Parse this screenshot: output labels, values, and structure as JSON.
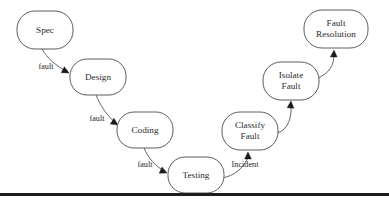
{
  "diagram": {
    "type": "flowchart",
    "style": {
      "node_fill": "#ffffff",
      "node_stroke": "#4a4a4a",
      "edge_stroke": "#555555",
      "arrow_fill": "#1a1a1a",
      "text_color": "#2b2b2b",
      "background": "#ffffff",
      "rule_color": "#1c1c1c"
    },
    "nodes": [
      {
        "id": "spec",
        "label": "Spec",
        "line1": "Spec",
        "line2": "",
        "cx": 45,
        "cy": 30,
        "rx": 28,
        "ry": 19
      },
      {
        "id": "design",
        "label": "Design",
        "line1": "Design",
        "line2": "",
        "cx": 98,
        "cy": 77,
        "rx": 28,
        "ry": 18
      },
      {
        "id": "coding",
        "label": "Coding",
        "line1": "Coding",
        "line2": "",
        "cx": 145,
        "cy": 130,
        "rx": 28,
        "ry": 18
      },
      {
        "id": "testing",
        "label": "Testing",
        "line1": "Testing",
        "line2": "",
        "cx": 196,
        "cy": 175,
        "rx": 28,
        "ry": 18
      },
      {
        "id": "classify",
        "label": "Classify Fault",
        "line1": "Classify",
        "line2": "Fault",
        "cx": 250,
        "cy": 131,
        "rx": 28,
        "ry": 19
      },
      {
        "id": "isolate",
        "label": "Isolate Fault",
        "line1": "Isolate",
        "line2": "Fault",
        "cx": 291,
        "cy": 81,
        "rx": 28,
        "ry": 19
      },
      {
        "id": "resolve",
        "label": "Fault Resolution",
        "line1": "Fault",
        "line2": "Resolution",
        "cx": 336,
        "cy": 29,
        "rx": 32,
        "ry": 19
      }
    ],
    "edges": [
      {
        "id": "e1",
        "from": "spec",
        "to": "design",
        "label": "fault",
        "label_x": 46,
        "label_y": 67,
        "path": "M 42 49 C 47 58 56 66 68 72"
      },
      {
        "id": "e2",
        "from": "design",
        "to": "coding",
        "label": "fault",
        "label_x": 97,
        "label_y": 119,
        "path": "M 96 95 C 100 105 107 116 117 124"
      },
      {
        "id": "e3",
        "from": "coding",
        "to": "testing",
        "label": "fault",
        "label_x": 145,
        "label_y": 165,
        "path": "M 144 148 C 148 158 156 167 166 172"
      },
      {
        "id": "e4",
        "from": "testing",
        "to": "classify",
        "label": "Incident",
        "label_x": 245,
        "label_y": 165,
        "path": "M 222 178 C 234 176 244 168 248 157"
      },
      {
        "id": "e5",
        "from": "classify",
        "to": "isolate",
        "label": "",
        "label_x": 0,
        "label_y": 0,
        "path": "M 277 133 C 288 130 292 118 291 104"
      },
      {
        "id": "e6",
        "from": "isolate",
        "to": "resolve",
        "label": "",
        "label_x": 0,
        "label_y": 0,
        "path": "M 318 78 C 329 73 334 66 334 54"
      }
    ],
    "arrows": [
      {
        "id": "a1",
        "edge": "e1",
        "x": 69,
        "y": 73,
        "angle": 28
      },
      {
        "id": "a2",
        "edge": "e2",
        "x": 118,
        "y": 125,
        "angle": 33
      },
      {
        "id": "a3",
        "edge": "e3",
        "x": 167,
        "y": 173,
        "angle": 24
      },
      {
        "id": "a4",
        "edge": "e4",
        "x": 248,
        "y": 152,
        "angle": -90
      },
      {
        "id": "a5",
        "edge": "e5",
        "x": 291,
        "y": 101,
        "angle": -86
      },
      {
        "id": "a6",
        "edge": "e6",
        "x": 334,
        "y": 50,
        "angle": -88
      }
    ],
    "footer_rule": {
      "x": 0,
      "y": 193,
      "width": 389,
      "height": 3
    }
  }
}
